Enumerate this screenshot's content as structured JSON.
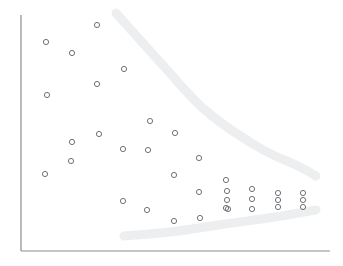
{
  "chart_data": {
    "type": "scatter",
    "title": "",
    "subtitle": "",
    "xlabel": "",
    "ylabel": "",
    "xlim": [
      21,
      330
    ],
    "ylim": [
      251,
      15
    ],
    "grid": false,
    "legend": null,
    "marker": {
      "shape": "open-circle",
      "radius": 2.6,
      "stroke_color": "#6f7279",
      "stroke_width": 1.0,
      "fill": "none"
    },
    "points": [
      {
        "x": 97,
        "y": 25
      },
      {
        "x": 46,
        "y": 42
      },
      {
        "x": 72,
        "y": 53
      },
      {
        "x": 124,
        "y": 69
      },
      {
        "x": 97,
        "y": 84
      },
      {
        "x": 47,
        "y": 95
      },
      {
        "x": 150,
        "y": 121
      },
      {
        "x": 99,
        "y": 134
      },
      {
        "x": 175,
        "y": 133
      },
      {
        "x": 72,
        "y": 142
      },
      {
        "x": 123,
        "y": 149
      },
      {
        "x": 148,
        "y": 150
      },
      {
        "x": 71,
        "y": 161
      },
      {
        "x": 199,
        "y": 158
      },
      {
        "x": 45,
        "y": 174
      },
      {
        "x": 174,
        "y": 175
      },
      {
        "x": 226,
        "y": 180
      },
      {
        "x": 199,
        "y": 192
      },
      {
        "x": 227,
        "y": 191
      },
      {
        "x": 252,
        "y": 189
      },
      {
        "x": 278,
        "y": 193
      },
      {
        "x": 303,
        "y": 193
      },
      {
        "x": 123,
        "y": 201
      },
      {
        "x": 227,
        "y": 200
      },
      {
        "x": 252,
        "y": 199
      },
      {
        "x": 278,
        "y": 200
      },
      {
        "x": 303,
        "y": 200
      },
      {
        "x": 147,
        "y": 210
      },
      {
        "x": 226,
        "y": 208
      },
      {
        "x": 228,
        "y": 209
      },
      {
        "x": 252,
        "y": 209
      },
      {
        "x": 278,
        "y": 207
      },
      {
        "x": 303,
        "y": 207
      },
      {
        "x": 174,
        "y": 221
      },
      {
        "x": 200,
        "y": 218
      }
    ],
    "annotations": [
      {
        "name": "upper-envelope",
        "kind": "highlighter-stroke",
        "color": "#eceef0",
        "stroke_width": 9,
        "path": [
          {
            "x": 116,
            "y": 13
          },
          {
            "x": 160,
            "y": 62
          },
          {
            "x": 205,
            "y": 110
          },
          {
            "x": 258,
            "y": 147
          },
          {
            "x": 300,
            "y": 167
          },
          {
            "x": 316,
            "y": 176
          }
        ]
      },
      {
        "name": "lower-envelope",
        "kind": "highlighter-stroke",
        "color": "#eceef0",
        "stroke_width": 9,
        "path": [
          {
            "x": 124,
            "y": 236
          },
          {
            "x": 170,
            "y": 232
          },
          {
            "x": 225,
            "y": 224
          },
          {
            "x": 275,
            "y": 217
          },
          {
            "x": 316,
            "y": 210
          }
        ]
      }
    ],
    "axes": {
      "y_axis": {
        "x": 21,
        "y_top": 15,
        "y_bottom": 251
      },
      "x_axis": {
        "y": 251,
        "x_left": 21,
        "x_right": 330
      },
      "color": "#8a8d92",
      "width": 1.2,
      "ticks": [],
      "tick_labels": []
    }
  }
}
